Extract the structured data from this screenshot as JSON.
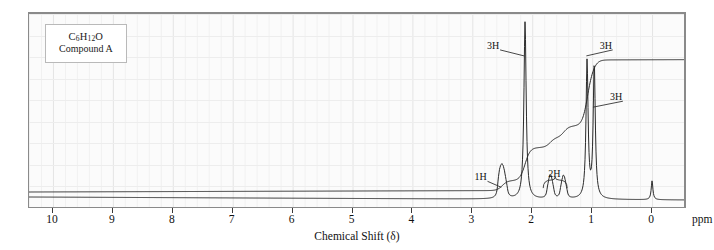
{
  "figure": {
    "sample_label_formula": "C6H12O",
    "sample_label_formula_parts": {
      "c": "C",
      "c_n": "6",
      "h": "H",
      "h_n": "12",
      "o": "O"
    },
    "sample_label_name": "Compound A",
    "axis_title": "Chemical Shift (δ)",
    "unit_label": "ppm",
    "frame_color": "#8a8a8a",
    "background_color": "#fbfbfb",
    "grid_color": "#ececec",
    "trace_color": "#2a2a2a"
  },
  "chart_data": {
    "type": "line",
    "title": "",
    "subtitle": "",
    "xlabel": "Chemical Shift (δ)",
    "ylabel": "",
    "unit": "ppm",
    "xlim": [
      10.4,
      -0.55
    ],
    "ylim": [
      0,
      1
    ],
    "axis_direction": "reversed",
    "grid": true,
    "legend": false,
    "tick_values": [
      10,
      9,
      8,
      7,
      6,
      5,
      4,
      3,
      2,
      1,
      0
    ],
    "tick_labels": [
      "10",
      "9",
      "8",
      "7",
      "6",
      "5",
      "4",
      "3",
      "2",
      "1",
      "0"
    ],
    "annotations": [
      {
        "text": "1H",
        "shift": 2.5,
        "label_x": 2.83,
        "label_y": 0.115,
        "leader": true
      },
      {
        "text": "3H",
        "shift": 2.12,
        "label_x": 2.62,
        "label_y": 0.845,
        "leader": true
      },
      {
        "text": "2H",
        "shift": 1.6,
        "label_x": 1.6,
        "label_y": 0.135,
        "leader": false,
        "brace": true
      },
      {
        "text": "3H",
        "shift": 1.08,
        "label_x": 0.74,
        "label_y": 0.845,
        "leader": true
      },
      {
        "text": "3H",
        "shift": 0.97,
        "label_x": 0.57,
        "label_y": 0.56,
        "leader": true
      }
    ],
    "peaks": [
      {
        "id": "multiplet-1h",
        "shift": 2.5,
        "height": 0.085,
        "protons": 1,
        "multiplicity": "multiplet"
      },
      {
        "id": "singlet-3h",
        "shift": 2.12,
        "height": 0.985,
        "protons": 3,
        "multiplicity": "singlet"
      },
      {
        "id": "multiplet-2h-a",
        "shift": 1.7,
        "height": 0.07,
        "protons": 1,
        "multiplicity": "multiplet"
      },
      {
        "id": "multiplet-2h-b",
        "shift": 1.47,
        "height": 0.07,
        "protons": 1,
        "multiplicity": "multiplet"
      },
      {
        "id": "doublet-3h-a",
        "shift": 1.08,
        "height": 0.76,
        "protons": 3,
        "multiplicity": "doublet"
      },
      {
        "id": "doublet-3h-b",
        "shift": 0.97,
        "height": 0.745,
        "protons": 3,
        "multiplicity": "doublet"
      },
      {
        "id": "tms-reference",
        "shift": 0.0,
        "height": 0.105,
        "protons": 0,
        "multiplicity": "singlet"
      }
    ],
    "integration_steps": [
      {
        "shift": 2.5,
        "rise": 0.06,
        "protons": 1
      },
      {
        "shift": 2.12,
        "rise": 0.2,
        "protons": 3
      },
      {
        "shift": 1.7,
        "rise": 0.06,
        "protons": 1
      },
      {
        "shift": 1.47,
        "rise": 0.07,
        "protons": 1
      },
      {
        "shift": 1.08,
        "rise": 0.34,
        "protons": 3
      },
      {
        "shift": 0.97,
        "rise": 0.06,
        "protons": 3
      }
    ]
  }
}
